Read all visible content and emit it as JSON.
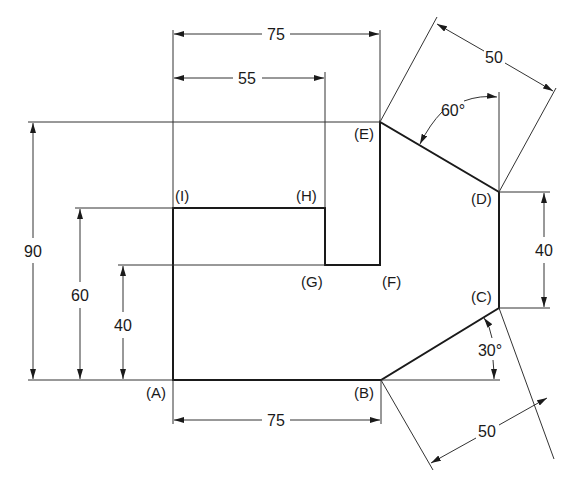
{
  "diagram": {
    "type": "engineering dimension drawing",
    "colors": {
      "line": "#1a1a1a",
      "background": "#ffffff"
    },
    "vertices": [
      {
        "id": "A",
        "label": "(A)"
      },
      {
        "id": "B",
        "label": "(B)"
      },
      {
        "id": "C",
        "label": "(C)"
      },
      {
        "id": "D",
        "label": "(D)"
      },
      {
        "id": "E",
        "label": "(E)"
      },
      {
        "id": "F",
        "label": "(F)"
      },
      {
        "id": "G",
        "label": "(G)"
      },
      {
        "id": "H",
        "label": "(H)"
      },
      {
        "id": "I",
        "label": "(I)"
      }
    ],
    "dimensions": {
      "top_75": "75",
      "top_55": "55",
      "left_90": "90",
      "left_60": "60",
      "left_40": "40",
      "bottom_75": "75",
      "right_40": "40",
      "upper_right_50": "50",
      "lower_right_50": "50",
      "angle_60": "60°",
      "angle_30": "30°"
    }
  }
}
